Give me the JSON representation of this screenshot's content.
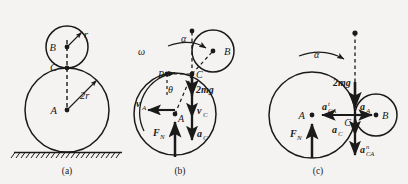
{
  "figure": {
    "background_color": "#f4f3f1",
    "ink_color": "#1a1a1a",
    "panels": [
      {
        "id": "a",
        "caption": "(a)",
        "description": "Geometry: small cylinder B of radius r resting on top of large cylinder A of radius 2r on the ground",
        "points": [
          {
            "name": "B",
            "label": "B"
          },
          {
            "name": "C",
            "label": "C"
          },
          {
            "name": "A",
            "label": "A"
          }
        ],
        "dimensions": [
          {
            "name": "small-radius",
            "label": "r"
          },
          {
            "name": "large-radius",
            "label": "2r"
          }
        ],
        "has_ground_hatching": true
      },
      {
        "id": "b",
        "caption": "(b)",
        "description": "Velocity diagram: angular velocity omega, angular acceleration alpha, contact point C, instant center P, angle theta",
        "points": [
          {
            "name": "B",
            "label": "B"
          },
          {
            "name": "C",
            "label": "C"
          },
          {
            "name": "A",
            "label": "A"
          },
          {
            "name": "P",
            "label": "P"
          }
        ],
        "angular": [
          {
            "name": "omega",
            "label": "ω"
          },
          {
            "name": "alpha",
            "label": "α"
          },
          {
            "name": "theta",
            "label": "θ"
          }
        ],
        "vectors": [
          {
            "name": "v-A",
            "base": "v",
            "sub": "A"
          },
          {
            "name": "weight-2mg",
            "base": "2mg",
            "sub": ""
          },
          {
            "name": "v-C",
            "base": "v",
            "sub": "C"
          },
          {
            "name": "a-C",
            "base": "a",
            "sub": "C"
          },
          {
            "name": "normal-force",
            "base": "F",
            "sub": "N"
          }
        ]
      },
      {
        "id": "c",
        "caption": "(c)",
        "description": "Acceleration diagram: relative acceleration components of C with respect to A, weight and normal force",
        "points": [
          {
            "name": "A",
            "label": "A"
          },
          {
            "name": "B",
            "label": "B"
          },
          {
            "name": "C",
            "label": "C"
          }
        ],
        "angular": [
          {
            "name": "alpha",
            "label": "α"
          }
        ],
        "vectors": [
          {
            "name": "weight-2mg",
            "base": "2mg",
            "sub": "",
            "sup": ""
          },
          {
            "name": "a-CA-tangential",
            "base": "a",
            "sub": "CA",
            "sup": "t"
          },
          {
            "name": "a-A",
            "base": "a",
            "sub": "A",
            "sup": ""
          },
          {
            "name": "a-C",
            "base": "a",
            "sub": "C",
            "sup": ""
          },
          {
            "name": "a-CA-normal",
            "base": "a",
            "sub": "CA",
            "sup": "n"
          },
          {
            "name": "normal-force",
            "base": "F",
            "sub": "N",
            "sup": ""
          }
        ]
      }
    ]
  }
}
